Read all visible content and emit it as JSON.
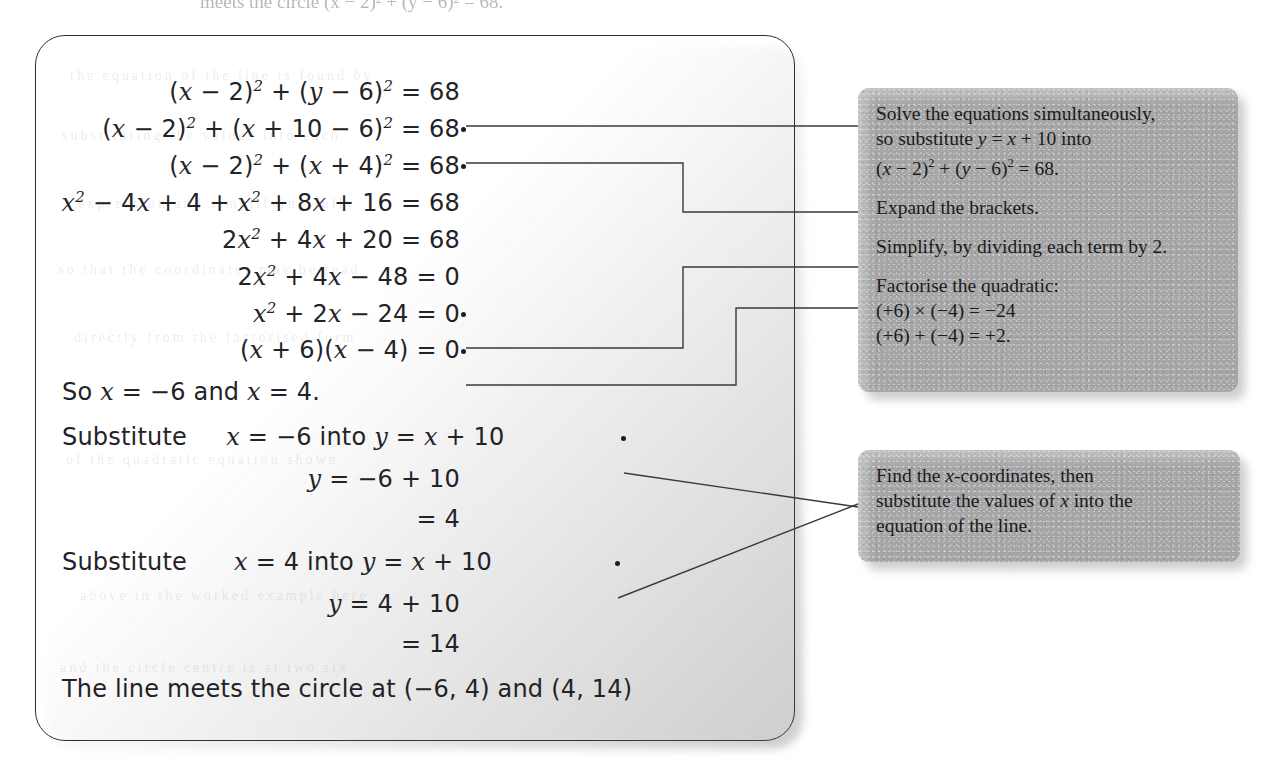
{
  "page": {
    "top_cropped_line": "meets the circle (x − 2)² + (y − 6)² = 68."
  },
  "working_box": {
    "name": "worked-solution-box",
    "lines": [
      {
        "id": "eq1",
        "align": "right",
        "top": 42,
        "html": "(<i>x</i> − 2)<sup>2</sup> + (<i>y</i> − 6)<sup>2</sup> = 68",
        "text": "(x − 2)^2 + (y − 6)^2 = 68",
        "connector": false
      },
      {
        "id": "eq2",
        "align": "right",
        "top": 79,
        "html": "(<i>x</i> − 2)<sup>2</sup> + (<i>x</i> + 10 − 6)<sup>2</sup> = 68",
        "text": "(x − 2)^2 + (x + 10 − 6)^2 = 68",
        "connector": true
      },
      {
        "id": "eq3",
        "align": "right",
        "top": 116,
        "html": "(<i>x</i> − 2)<sup>2</sup> + (<i>x</i> + 4)<sup>2</sup> = 68",
        "text": "(x − 2)^2 + (x + 4)^2 = 68",
        "connector": true
      },
      {
        "id": "eq4",
        "align": "right",
        "top": 153,
        "html": "<i>x</i><sup>2</sup> − 4<i>x</i> + 4 + <i>x</i><sup>2</sup> + 8<i>x</i> + 16 = 68",
        "text": "x^2 − 4x + 4 + x^2 + 8x + 16 = 68",
        "connector": false
      },
      {
        "id": "eq5",
        "align": "right",
        "top": 190,
        "html": "2<i>x</i><sup>2</sup> + 4<i>x</i> + 20 = 68",
        "text": "2x^2 + 4x + 20 = 68",
        "connector": false
      },
      {
        "id": "eq6",
        "align": "right",
        "top": 227,
        "html": "2<i>x</i><sup>2</sup> + 4<i>x</i> − 48 = 0",
        "text": "2x^2 + 4x − 48 = 0",
        "connector": false
      },
      {
        "id": "eq7",
        "align": "right",
        "top": 264,
        "html": "<i>x</i><sup>2</sup> + 2<i>x</i> − 24 = 0",
        "text": "x^2 + 2x − 24 = 0",
        "connector": true
      },
      {
        "id": "eq8",
        "align": "right",
        "top": 301,
        "html": "(<i>x</i> + 6)(<i>x</i> − 4) = 0",
        "text": "(x + 6)(x − 4) = 0",
        "connector": true
      },
      {
        "id": "pr1",
        "align": "left",
        "top": 343,
        "html": "So <i>x</i> = −6 and <i>x</i> = 4.",
        "text": "So x = −6 and x = 4.",
        "connector": false
      },
      {
        "id": "pr2",
        "align": "left",
        "top": 388,
        "html": "Substitute&nbsp;&nbsp;&nbsp;&nbsp;&nbsp;<i>x</i> = −6 into <i>y</i> = <i>x</i> + 10",
        "text": "Substitute   x = −6 into y = x + 10",
        "connector": true
      },
      {
        "id": "eq9",
        "align": "right",
        "top": 430,
        "html": "<i>y</i> = −6 + 10",
        "text": "y = −6 + 10",
        "connector": false
      },
      {
        "id": "eq10",
        "align": "right",
        "top": 470,
        "html": "= 4",
        "text": "= 4",
        "connector": false
      },
      {
        "id": "pr3",
        "align": "left",
        "top": 513,
        "html": "Substitute&nbsp;&nbsp;&nbsp;&nbsp;&nbsp;&nbsp;<i>x</i> = 4 into <i>y</i> = <i>x</i> + 10",
        "text": "Substitute    x = 4 into y = x + 10",
        "connector": true
      },
      {
        "id": "eq11",
        "align": "right",
        "top": 555,
        "html": "<i>y</i> = 4 + 10",
        "text": "y = 4 + 10",
        "connector": false
      },
      {
        "id": "eq12",
        "align": "right",
        "top": 595,
        "html": "= 14",
        "text": "= 14",
        "connector": false
      },
      {
        "id": "pr4",
        "align": "left",
        "top": 640,
        "html": "The line meets the circle at (−6, 4) and (4, 14)",
        "text": "The line meets the circle at (−6, 4) and (4, 14)",
        "connector": false
      }
    ]
  },
  "callouts": [
    {
      "id": "callout-method",
      "name": "callout-box-method",
      "lines": [
        {
          "html": "Solve the equations simultaneously,",
          "text": "Solve the equations simultaneously,"
        },
        {
          "html": "so substitute <i>y</i> = <i>x</i> + 10 into",
          "text": "so substitute y = x + 10 into"
        },
        {
          "html": "(<i>x</i> − 2)<sup>2</sup> + (<i>y</i> − 6)<sup>2</sup> = 68.",
          "text": "(x − 2)^2 + (y − 6)^2 = 68."
        },
        {
          "gap": true,
          "html": "Expand the brackets.",
          "text": "Expand the brackets."
        },
        {
          "gap": true,
          "html": "Simplify, by dividing each term by 2.",
          "text": "Simplify, by dividing each term by 2."
        },
        {
          "gap": true,
          "html": "Factorise the quadratic:",
          "text": "Factorise the quadratic:"
        },
        {
          "html": "(+6) × (−4) = −24",
          "text": "(+6) × (−4) = −24"
        },
        {
          "html": "(+6) + (−4) = +2.",
          "text": "(+6) + (−4) = +2."
        }
      ]
    },
    {
      "id": "callout-coords",
      "name": "callout-box-coordinates",
      "lines": [
        {
          "html": "Find the <i>x</i>-coordinates, then",
          "text": "Find the x-coordinates, then"
        },
        {
          "html": "substitute the values of <i>x</i> into the",
          "text": "substitute the values of x into the"
        },
        {
          "html": "equation of the line.",
          "text": "equation of the line."
        }
      ]
    }
  ],
  "colors": {
    "ink": "#232327",
    "callout_fill": "#c3c3c3",
    "box_border": "#2e2e2e",
    "connector": "#3a3a3e"
  },
  "bleed_text": [
    "the equation of the line is found by",
    "substituting the values into each",
    "expression and simplifying fully",
    "so that the coordinates may be read",
    "directly from the factorised form",
    "of the quadratic equation shown",
    "above in the worked example here",
    "and the circle centre is at two six"
  ]
}
